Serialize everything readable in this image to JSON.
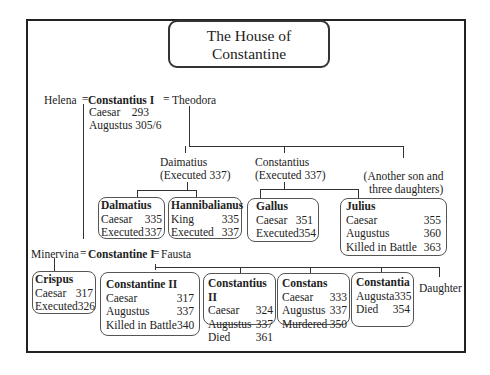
{
  "title": {
    "line1": "The House of",
    "line2": "Constantine"
  },
  "gen1": {
    "left_spouse": "Helena",
    "eq1": "=",
    "name": "Constantius I",
    "eq2": "=",
    "right_spouse": "Theodora",
    "roles": [
      {
        "label": "Caesar",
        "year": "293"
      },
      {
        "label": "Augustus",
        "year": "305/6"
      }
    ]
  },
  "theodora_children": [
    {
      "name": "Daimatius",
      "note": "(Executed 337)"
    },
    {
      "name": "Constantius",
      "note": "(Executed 337)"
    },
    {
      "name": "(Another son and",
      "note": "three daughters)"
    }
  ],
  "grandchildren_boxes": [
    {
      "name": "Dalmatius",
      "rows": [
        {
          "label": "Caesar",
          "year": "335"
        },
        {
          "label": "Executed",
          "year": "337"
        }
      ]
    },
    {
      "name": "Hannibalianus",
      "rows": [
        {
          "label": "King",
          "year": "335"
        },
        {
          "label": "Executed",
          "year": "337"
        }
      ]
    },
    {
      "name": "Gallus",
      "rows": [
        {
          "label": "Caesar",
          "year": "351"
        },
        {
          "label": "Executed",
          "year": "354"
        }
      ]
    },
    {
      "name": "Julius",
      "rows": [
        {
          "label": "Caesar",
          "year": "355"
        },
        {
          "label": "Augustus",
          "year": "360"
        },
        {
          "label": "Killed in Battle",
          "year": "363"
        }
      ]
    }
  ],
  "gen2": {
    "left_spouse": "Minervina",
    "eq1": "=",
    "name": "Constantine I",
    "eq2": "=",
    "right_spouse": "Fausta"
  },
  "constantine_children": [
    {
      "name": "Crispus",
      "rows": [
        {
          "label": "Caesar",
          "year": "317"
        },
        {
          "label": "Executed",
          "year": "326"
        }
      ]
    },
    {
      "name": "Constantine II",
      "rows": [
        {
          "label": "Caesar",
          "year": "317"
        },
        {
          "label": "Augustus",
          "year": "337"
        },
        {
          "label": "Killed in Battle",
          "year": "340"
        }
      ]
    },
    {
      "name": "Constantius II",
      "rows": [
        {
          "label": "Caesar",
          "year": "324"
        },
        {
          "label": "Augustus",
          "year": "337"
        },
        {
          "label": "Died",
          "year": "361"
        }
      ]
    },
    {
      "name": "Constans",
      "rows": [
        {
          "label": "Caesar",
          "year": "333"
        },
        {
          "label": "Augustus",
          "year": "337"
        },
        {
          "label": "Murdered",
          "year": "350"
        }
      ]
    },
    {
      "name": "Constantia",
      "rows": [
        {
          "label": "Augusta",
          "year": "335"
        },
        {
          "label": "Died",
          "year": "354"
        }
      ]
    }
  ],
  "daughter_label": "Daughter"
}
